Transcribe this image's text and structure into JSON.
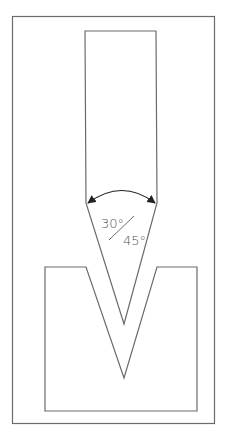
{
  "diagram": {
    "angle_label_top": "30°",
    "angle_label_bottom": "45°",
    "colors": {
      "stroke": "#6b6b6b",
      "arrow": "#222222",
      "background": "#ffffff"
    },
    "components": [
      "outer-frame",
      "punch-blade",
      "v-die",
      "angle-arc"
    ]
  }
}
